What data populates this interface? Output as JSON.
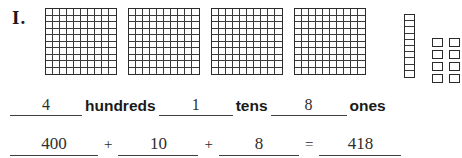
{
  "worksheet": {
    "problem_number": "I.",
    "type": "base-ten-blocks-place-value"
  },
  "blocks": {
    "hundreds_flats": {
      "count": 4,
      "cells_per_flat": 100,
      "rows": 10,
      "columns": 10,
      "icon": "hundreds-flat-icon"
    },
    "tens_rods": {
      "count": 1,
      "cells_per_rod": 10,
      "icon": "tens-rod-icon"
    },
    "ones_cubes": {
      "count": 8,
      "rows": 4,
      "columns": 2,
      "icon": "ones-cube-icon"
    }
  },
  "place_value_line": {
    "hundreds_answer": "4",
    "hundreds_label": "hundreds",
    "tens_answer": "1",
    "tens_label": "tens",
    "ones_answer": "8",
    "ones_label": "ones"
  },
  "equation_line": {
    "addend_hundreds": "400",
    "plus_1": "+",
    "addend_tens": "10",
    "plus_2": "+",
    "addend_ones": "8",
    "equals": "=",
    "sum": "418"
  },
  "colors": {
    "ink": "#1a1a1a",
    "pencil": "#2e2e2e",
    "rule_line": "#3f3f3f",
    "block_outline": "#2b2b2b",
    "block_grid": "#3a3a3a",
    "paper": "#ffffff"
  }
}
